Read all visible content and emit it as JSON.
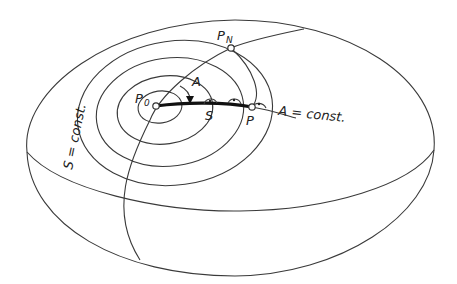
{
  "diagram": {
    "labels": {
      "p0": "P",
      "p0_sub": "0",
      "pn": "P",
      "pn_sub": "N",
      "p": "P",
      "azimuth": "A",
      "distance": "S",
      "azimuth_const": "A = const.",
      "distance_const": "S = const."
    },
    "points": [
      {
        "name": "P0",
        "x": 156,
        "y": 106
      },
      {
        "name": "PN",
        "x": 231,
        "y": 48
      },
      {
        "name": "P",
        "x": 252,
        "y": 107
      }
    ],
    "colors": {
      "line": "#3a3a3a",
      "geodesic": "#111111",
      "background": "#ffffff"
    }
  }
}
